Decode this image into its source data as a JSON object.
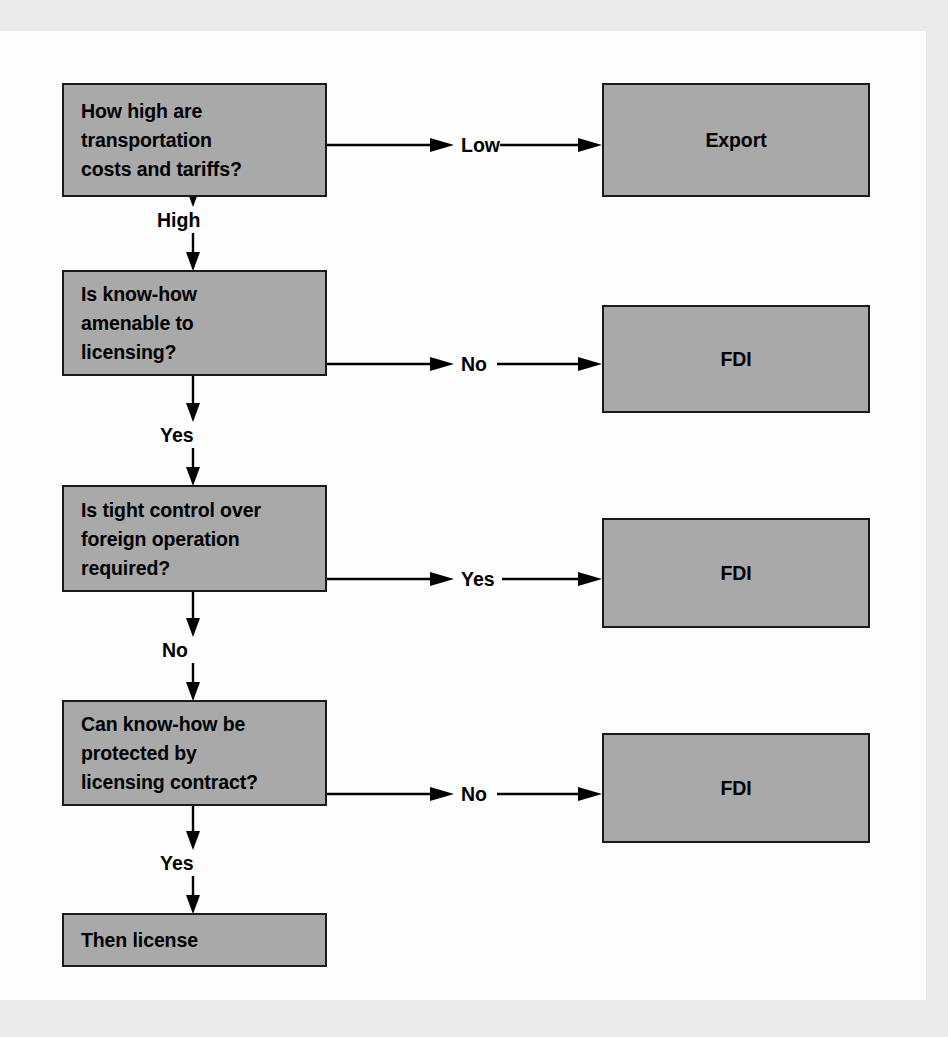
{
  "diagram": {
    "colors": {
      "node_fill": "#a9a9a9",
      "node_border": "#1a1a1a",
      "page_background": "#fdfdfd",
      "mat_background": "#eaeaea",
      "text": "#000000"
    },
    "decision_nodes": [
      {
        "id": "q1",
        "text": "How high are\ntransportation\ncosts and tariffs?"
      },
      {
        "id": "q2",
        "text": "Is know-how\namenable to\nlicensing?"
      },
      {
        "id": "q3",
        "text": "Is tight control over\nforeign operation\nrequired?"
      },
      {
        "id": "q4",
        "text": "Can know-how be\nprotected by\nlicensing contract?"
      }
    ],
    "outcome_nodes": [
      {
        "id": "o1",
        "text": "Export"
      },
      {
        "id": "o2",
        "text": "FDI"
      },
      {
        "id": "o3",
        "text": "FDI"
      },
      {
        "id": "o4",
        "text": "FDI"
      },
      {
        "id": "o5",
        "text": "Then license"
      }
    ],
    "branch_labels": {
      "q1_right": "Low",
      "q1_down": "High",
      "q2_right": "No",
      "q2_down": "Yes",
      "q3_right": "Yes",
      "q3_down": "No",
      "q4_right": "No",
      "q4_down": "Yes"
    }
  }
}
